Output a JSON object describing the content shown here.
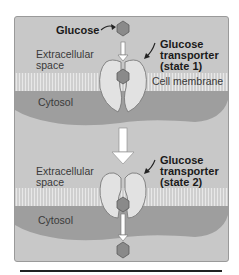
{
  "figure": {
    "top": {
      "glucose_label": "Glucose",
      "extracellular_line1": "Extracellular",
      "extracellular_line2": "space",
      "transporter_line1": "Glucose",
      "transporter_line2": "transporter",
      "transporter_line3": "(state 1)",
      "membrane_label": "Cell membrane",
      "cytosol_label": "Cytosol"
    },
    "bottom": {
      "extracellular_line1": "Extracellular",
      "extracellular_line2": "space",
      "transporter_line1": "Glucose",
      "transporter_line2": "transporter",
      "transporter_line3": "(state 2)",
      "cytosol_label": "Cytosol"
    },
    "colors": {
      "panel_bg": "#c8c8c8",
      "membrane": "#d4d4d4",
      "cytosol": "#9e9e9e",
      "transporter": "#e2e2e2",
      "glucose": "#8a8a8a",
      "arrow": "#ffffff"
    }
  }
}
